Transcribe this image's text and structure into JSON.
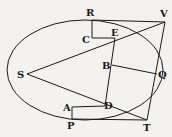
{
  "diagram": {
    "type": "geometric-figure",
    "stroke_color": "#1a1a1a",
    "background": "#f4f2ee",
    "ellipse": {
      "cx": 85,
      "cy": 70,
      "rx": 78,
      "ry": 50
    },
    "points": {
      "R": {
        "label": "R",
        "x": 92,
        "y": 20,
        "lx": 86,
        "ly": 16
      },
      "V": {
        "label": "V",
        "x": 165,
        "y": 22,
        "lx": 160,
        "ly": 17
      },
      "C": {
        "label": "C",
        "x": 92,
        "y": 38,
        "lx": 82,
        "ly": 43
      },
      "E": {
        "label": "E",
        "x": 115,
        "y": 38,
        "lx": 111,
        "ly": 36
      },
      "S": {
        "label": "S",
        "x": 27,
        "y": 74,
        "lx": 17,
        "ly": 78
      },
      "B": {
        "label": "B",
        "x": 112,
        "y": 65,
        "lx": 102,
        "ly": 69
      },
      "Q": {
        "label": "Q",
        "x": 157,
        "y": 74,
        "lx": 158,
        "ly": 78
      },
      "A": {
        "label": "A",
        "x": 72,
        "y": 107,
        "lx": 63,
        "ly": 111
      },
      "D": {
        "label": "D",
        "x": 105,
        "y": 106,
        "lx": 104,
        "ly": 109
      },
      "P": {
        "label": "P",
        "x": 72,
        "y": 119,
        "lx": 67,
        "ly": 129
      },
      "T": {
        "label": "T",
        "x": 147,
        "y": 120,
        "lx": 143,
        "ly": 131
      }
    },
    "segments": [
      [
        "R",
        "V"
      ],
      [
        "R",
        "C"
      ],
      [
        "C",
        "E"
      ],
      [
        "S",
        "V"
      ],
      [
        "S",
        "T"
      ],
      [
        "E",
        "D"
      ],
      [
        "B",
        "Q"
      ],
      [
        "V",
        "T"
      ],
      [
        "A",
        "D"
      ],
      [
        "A",
        "P"
      ],
      [
        "P",
        "T"
      ]
    ]
  }
}
